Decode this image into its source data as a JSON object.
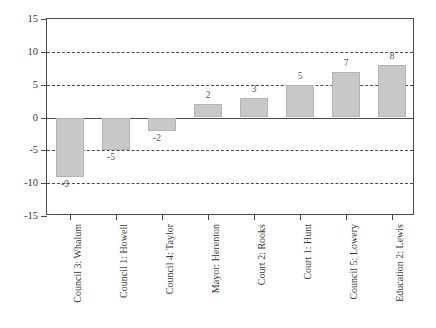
{
  "chart_data": {
    "type": "bar",
    "title": "",
    "subtitle": "",
    "xlabel": "",
    "ylabel": "",
    "ylim": [
      -15,
      15
    ],
    "yticks": [
      15,
      10,
      5,
      0,
      -5,
      -10,
      -15
    ],
    "ytick_labels": [
      "15",
      "10",
      "5",
      "0",
      "-5",
      "-10",
      "-15"
    ],
    "grid": true,
    "gridlines_at": [
      10,
      5,
      -5,
      -10
    ],
    "legend": "none",
    "orientation": "vertical",
    "bar_color": "#c8c8c8",
    "bar_edge_color": "#b4b4b4",
    "axis_color": "#4a4a4a",
    "categories": [
      "Council 3: Whalum",
      "Council 1: Howell",
      "Council 4: Taylor",
      "Mayor: Herenton",
      "Court 2: Rooks",
      "Court 1: Hunt",
      "Council 5: Lowery",
      "Education 2: Lewis"
    ],
    "values": [
      -9,
      -5,
      -2,
      2,
      3,
      5,
      7,
      8
    ],
    "value_labels": [
      "-9",
      "-5",
      "-2",
      "2",
      "3",
      "5",
      "7",
      "8"
    ]
  }
}
